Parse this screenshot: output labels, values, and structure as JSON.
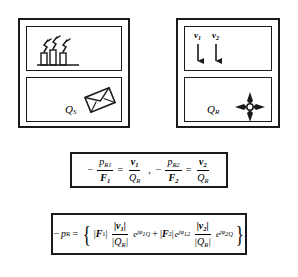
{
  "figure": {
    "panels": [
      {
        "id": "source-panel",
        "name": "left-panel",
        "top_subpanel": {
          "id": "factory-subpanel",
          "icon": "factory-chimneys-icon",
          "chimney_count": 3
        },
        "bottom_subpanel": {
          "id": "source-strength-subpanel",
          "label": "Q",
          "label_sub": "S",
          "icon": "envelope-icon"
        }
      },
      {
        "id": "receiver-panel",
        "name": "right-panel",
        "top_subpanel": {
          "id": "velocity-subpanel",
          "velocities": [
            {
              "symbol": "v",
              "sub": "1",
              "arrow": "down-arrow-icon"
            },
            {
              "symbol": "v",
              "sub": "2",
              "arrow": "down-arrow-icon"
            }
          ]
        },
        "bottom_subpanel": {
          "id": "receiver-strength-subpanel",
          "label": "Q",
          "label_sub": "R",
          "icon": "four-direction-star-icon"
        }
      }
    ],
    "equation_box_1": {
      "id": "transfer-ratio-equation",
      "terms": [
        {
          "minus": "−",
          "num": "p",
          "num_sub": "R1",
          "den": "F",
          "den_sub": "1",
          "equals": "=",
          "rhs_num": "v",
          "rhs_num_sub": "1",
          "rhs_den": "Q",
          "rhs_den_sub": "R"
        },
        {
          "minus": "−",
          "num": "p",
          "num_sub": "R2",
          "den": "F",
          "den_sub": "2",
          "equals": "=",
          "rhs_num": "v",
          "rhs_num_sub": "2",
          "rhs_den": "Q",
          "rhs_den_sub": "R"
        }
      ],
      "separator": ","
    },
    "equation_box_2": {
      "id": "receiver-pressure-equation",
      "lhs_minus": "−",
      "lhs_symbol": "p",
      "lhs_sub": "R",
      "equals": "=",
      "open_brace": "{",
      "close_brace": "}",
      "term1": {
        "mag_F_open": "|",
        "mag_F_symbol": "F",
        "mag_F_sub": "1",
        "mag_F_close": "|",
        "frac_num": "|v",
        "frac_num_sub": "1",
        "frac_num_close": "|",
        "frac_den": "|Q",
        "frac_den_sub": "R",
        "frac_den_close": "|",
        "exp_base": "e",
        "exp_j": "j",
        "exp_phi": "φ",
        "exp_phi_sub": "1Q"
      },
      "plus": "+",
      "term2": {
        "mag_F_open": "|",
        "mag_F_symbol": "F",
        "mag_F_sub": "2",
        "mag_F_close": "|",
        "exp1_base": "e",
        "exp1_j": "j",
        "exp1_phi": "φ",
        "exp1_phi_sub": "12",
        "frac_num": "|v",
        "frac_num_sub": "2",
        "frac_num_close": "|",
        "frac_den": "|Q",
        "frac_den_sub": "R",
        "frac_den_close": "|",
        "exp_base": "e",
        "exp_j": "j",
        "exp_phi": "φ",
        "exp_phi_sub": "2Q"
      }
    },
    "colors": {
      "stroke": "#1a1a1a",
      "background": "#ffffff",
      "text": "#000000"
    }
  }
}
